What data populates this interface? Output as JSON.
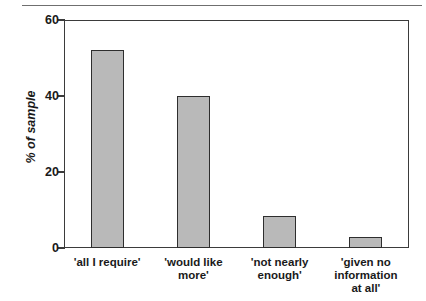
{
  "chart_data": {
    "type": "bar",
    "title": "",
    "subtitle": "",
    "xlabel": "",
    "ylabel": "% of sample",
    "categories": [
      "'all I require'",
      "'would like\nmore'",
      "'not nearly\nenough'",
      "'given no\ninformation\nat all'"
    ],
    "values": [
      52,
      40,
      8.5,
      3
    ],
    "ylim": [
      0,
      60
    ],
    "yticks": [
      0,
      20,
      40,
      60
    ],
    "ytick_labels": [
      "0",
      "20",
      "40",
      "60"
    ],
    "grid": false,
    "legend": null,
    "bar_fill_color": "#b9b9b9",
    "bar_edge_color": "#2e2e2e",
    "axis_color": "#3b3b3b",
    "text_color": "#1a1a1a",
    "background_color": "#ffffff"
  }
}
